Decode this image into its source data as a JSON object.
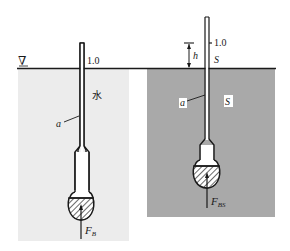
{
  "figure": {
    "colors": {
      "background": "#ffffff",
      "water_fill": "#ececec",
      "liquid_fill": "#a9a9a9",
      "line": "#1a1a1a",
      "bulb_fill": "#ffffff"
    },
    "left_panel": {
      "free_surface_symbol": "∇",
      "scale_mark": "1.0",
      "liquid_label": "水",
      "stem_label": "a",
      "force_label": "F",
      "force_subscript": "B"
    },
    "right_panel": {
      "height_label": "h",
      "scale_mark": "1.0",
      "surface_label": "S",
      "liquid_label": "S",
      "stem_label": "a",
      "force_label": "F",
      "force_subscript": "BS"
    }
  }
}
